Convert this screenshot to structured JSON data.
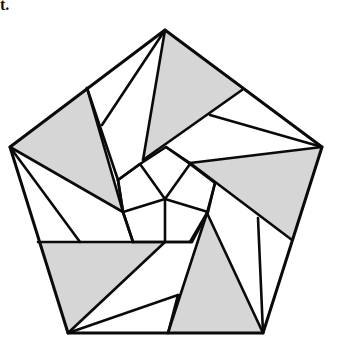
{
  "caption_fragment": "t.",
  "figure": {
    "colors": {
      "shade": "#d6d6d6",
      "line": "#0a0a0a",
      "background": "#ffffff"
    },
    "outer_pentagon": [
      [
        165,
        30
      ],
      [
        322,
        147
      ],
      [
        263,
        333
      ],
      [
        68,
        333
      ],
      [
        10,
        147
      ]
    ],
    "shaded_regions": [
      [
        [
          165,
          30
        ],
        [
          242,
          90
        ],
        [
          143,
          160
        ]
      ],
      [
        [
          322,
          147
        ],
        [
          292,
          240
        ],
        [
          190,
          163
        ]
      ],
      [
        [
          263,
          333
        ],
        [
          168,
          333
        ],
        [
          207,
          213
        ]
      ],
      [
        [
          68,
          333
        ],
        [
          38,
          242
        ],
        [
          165,
          242
        ]
      ],
      [
        [
          10,
          147
        ],
        [
          87,
          88
        ],
        [
          123,
          212
        ]
      ]
    ],
    "segments": [
      [
        [
          165,
          30
        ],
        [
          102,
          125
        ]
      ],
      [
        [
          165,
          30
        ],
        [
          143,
          160
        ]
      ],
      [
        [
          87,
          88
        ],
        [
          118,
          180
        ]
      ],
      [
        [
          118,
          180
        ],
        [
          123,
          212
        ]
      ],
      [
        [
          118,
          180
        ],
        [
          140,
          164
        ]
      ],
      [
        [
          143,
          160
        ],
        [
          242,
          90
        ]
      ],
      [
        [
          210,
          115
        ],
        [
          322,
          147
        ]
      ],
      [
        [
          166,
          147
        ],
        [
          190,
          163
        ]
      ],
      [
        [
          190,
          163
        ],
        [
          322,
          147
        ]
      ],
      [
        [
          190,
          163
        ],
        [
          292,
          240
        ]
      ],
      [
        [
          140,
          164
        ],
        [
          165,
          199
        ]
      ],
      [
        [
          190,
          164
        ],
        [
          165,
          199
        ]
      ],
      [
        [
          123,
          212
        ],
        [
          165,
          199
        ]
      ],
      [
        [
          208,
          212
        ],
        [
          165,
          199
        ]
      ],
      [
        [
          165,
          199
        ],
        [
          165,
          242
        ]
      ],
      [
        [
          215,
          183
        ],
        [
          207,
          213
        ]
      ],
      [
        [
          207,
          213
        ],
        [
          168,
          333
        ]
      ],
      [
        [
          207,
          213
        ],
        [
          263,
          333
        ]
      ],
      [
        [
          258,
          218
        ],
        [
          263,
          333
        ]
      ],
      [
        [
          38,
          242
        ],
        [
          192,
          242
        ]
      ],
      [
        [
          165,
          242
        ],
        [
          68,
          333
        ]
      ],
      [
        [
          68,
          333
        ],
        [
          178,
          295
        ]
      ],
      [
        [
          123,
          212
        ],
        [
          133,
          242
        ]
      ],
      [
        [
          10,
          147
        ],
        [
          123,
          212
        ]
      ],
      [
        [
          10,
          147
        ],
        [
          80,
          242
        ]
      ],
      [
        [
          87,
          88
        ],
        [
          123,
          212
        ]
      ],
      [
        [
          178,
          295
        ],
        [
          168,
          333
        ]
      ],
      [
        [
          190,
          242
        ],
        [
          207,
          213
        ]
      ]
    ]
  }
}
